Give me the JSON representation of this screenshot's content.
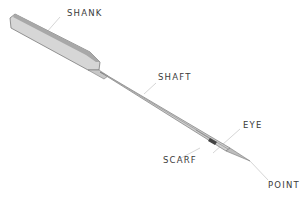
{
  "diagram": {
    "labels": {
      "shank": "SHANK",
      "shaft": "SHAFT",
      "eye": "EYE",
      "scarf": "SCARF",
      "point": "POINT"
    },
    "colors": {
      "needle_fill": "#d4d4d4",
      "needle_dark": "#9a9a9a",
      "needle_outline": "#7a7a7a",
      "leader_line": "#d0d0d0",
      "label_text": "#3a3a3a",
      "eye_dark": "#444444"
    }
  }
}
